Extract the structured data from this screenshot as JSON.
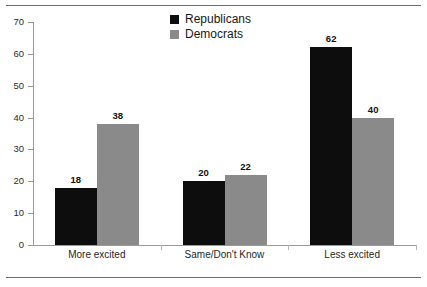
{
  "chart_data": {
    "type": "bar",
    "title": "",
    "subtitle": "",
    "xlabel": "",
    "ylabel": "",
    "ylim": [
      0,
      70
    ],
    "yticks": [
      0,
      10,
      20,
      30,
      40,
      50,
      60,
      70
    ],
    "grid": false,
    "legend_position": "top-center",
    "categories": [
      "More excited",
      "Same/Don't Know",
      "Less excited"
    ],
    "series": [
      {
        "name": "Republicans",
        "color": "#0d0d0d",
        "values": [
          18,
          20,
          62
        ]
      },
      {
        "name": "Democrats",
        "color": "#8a8a8a",
        "values": [
          38,
          22,
          40
        ]
      }
    ],
    "value_labels": [
      [
        "18",
        "38"
      ],
      [
        "20",
        "22"
      ],
      [
        "62",
        "40"
      ]
    ],
    "ytick_labels": [
      "0",
      "10",
      "20",
      "30",
      "40",
      "50",
      "60",
      "70"
    ]
  },
  "legend": {
    "items": [
      {
        "label": "Republicans",
        "swatch": "legend-swatch-republicans"
      },
      {
        "label": "Democrats",
        "swatch": "legend-swatch-democrats"
      }
    ]
  },
  "rules": {
    "top": "horizontal-rule-top",
    "bottom": "horizontal-rule-bottom"
  },
  "colors": {
    "republicans": "#0d0d0d",
    "democrats": "#8a8a8a",
    "axis": "#9a9a9a",
    "rule": "#6e6e6e",
    "background": "#ffffff"
  }
}
